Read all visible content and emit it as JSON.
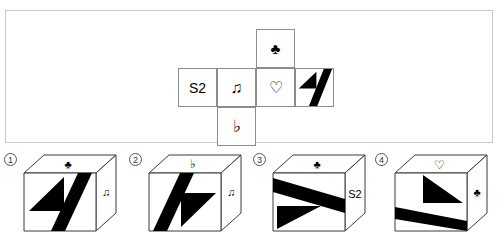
{
  "puzzle": {
    "type": "cube-net-folding",
    "net": {
      "layout": "cross",
      "cells": [
        {
          "id": "top",
          "row": 0,
          "col": 2,
          "content_kind": "glyph",
          "label": "♣",
          "name": "club"
        },
        {
          "id": "left",
          "row": 1,
          "col": 0,
          "content_kind": "text",
          "label": "S2",
          "name": "s2-text"
        },
        {
          "id": "mid-left",
          "row": 1,
          "col": 1,
          "content_kind": "glyph",
          "label": "♫",
          "name": "beamed-eighth-notes"
        },
        {
          "id": "mid-right",
          "row": 1,
          "col": 2,
          "content_kind": "glyph",
          "label": "♡",
          "name": "heart-outline"
        },
        {
          "id": "right",
          "row": 1,
          "col": 3,
          "content_kind": "pattern",
          "label": "",
          "name": "black-triangle-stripe"
        },
        {
          "id": "bottom",
          "row": 2,
          "col": 1,
          "content_kind": "glyph",
          "label": "♭",
          "name": "music-flat"
        }
      ]
    },
    "options": [
      {
        "number": "①",
        "number_plain": "1",
        "top_face": {
          "kind": "glyph",
          "label": "♣",
          "name": "club"
        },
        "front_face": {
          "kind": "pattern",
          "name": "triangle-stripe",
          "variant": "base"
        },
        "right_face": {
          "kind": "glyph",
          "label": "♫",
          "name": "beamed-eighth-notes"
        }
      },
      {
        "number": "②",
        "number_plain": "2",
        "top_face": {
          "kind": "glyph",
          "label": "♭",
          "name": "music-flat"
        },
        "front_face": {
          "kind": "pattern",
          "name": "triangle-stripe",
          "variant": "rot180"
        },
        "right_face": {
          "kind": "glyph",
          "label": "♫",
          "name": "beamed-eighth-notes"
        }
      },
      {
        "number": "③",
        "number_plain": "3",
        "top_face": {
          "kind": "glyph",
          "label": "♣",
          "name": "club"
        },
        "front_face": {
          "kind": "pattern",
          "name": "triangle-stripe",
          "variant": "rot90"
        },
        "right_face": {
          "kind": "text",
          "label": "S2",
          "name": "s2-text"
        }
      },
      {
        "number": "④",
        "number_plain": "4",
        "top_face": {
          "kind": "glyph",
          "label": "♡",
          "name": "heart-outline"
        },
        "front_face": {
          "kind": "pattern",
          "name": "triangle-stripe",
          "variant": "rot270"
        },
        "right_face": {
          "kind": "glyph",
          "label": "♣",
          "name": "club"
        }
      }
    ]
  },
  "colors": {
    "ink": "#000000",
    "panel_border": "#c9c9c9",
    "cell_border": "#8c8c8c",
    "cube_edge": "#3a3a3a",
    "face_fill": "#ffffff",
    "page_background": "#ffffff"
  }
}
